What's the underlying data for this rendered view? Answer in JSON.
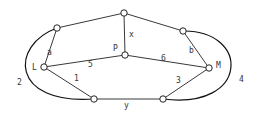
{
  "diagram": {
    "type": "graph",
    "nodes": [
      {
        "id": "A",
        "label": "",
        "x": 57,
        "y": 28
      },
      {
        "id": "T",
        "label": "",
        "x": 124,
        "y": 13
      },
      {
        "id": "B",
        "label": "",
        "x": 183,
        "y": 31
      },
      {
        "id": "L",
        "label": "L",
        "x": 44,
        "y": 67
      },
      {
        "id": "P",
        "label": "P",
        "x": 125,
        "y": 55
      },
      {
        "id": "M",
        "label": "M",
        "x": 209,
        "y": 68
      },
      {
        "id": "Y1",
        "label": "",
        "x": 94,
        "y": 99
      },
      {
        "id": "Y2",
        "label": "",
        "x": 163,
        "y": 99
      }
    ],
    "edges": [
      {
        "from": "A",
        "to": "T",
        "label": ""
      },
      {
        "from": "T",
        "to": "B",
        "label": ""
      },
      {
        "from": "T",
        "to": "P",
        "label": "x"
      },
      {
        "from": "A",
        "to": "L",
        "label": "a"
      },
      {
        "from": "B",
        "to": "M",
        "label": "b"
      },
      {
        "from": "L",
        "to": "P",
        "label": "5"
      },
      {
        "from": "P",
        "to": "M",
        "label": "6"
      },
      {
        "from": "L",
        "to": "Y1",
        "label": "1"
      },
      {
        "from": "M",
        "to": "Y2",
        "label": "3"
      },
      {
        "from": "Y1",
        "to": "Y2",
        "label": "y"
      },
      {
        "from": "A",
        "to": "Y1",
        "label": "2",
        "curved": true
      },
      {
        "from": "B",
        "to": "Y2",
        "label": "4",
        "curved": true
      }
    ],
    "labels": {
      "L": "L",
      "P": "P",
      "M": "M",
      "x": "x",
      "y": "y",
      "a": "a",
      "b": "b",
      "e1": "1",
      "e2": "2",
      "e3": "3",
      "e4": "4",
      "e5": "5",
      "e6": "6"
    }
  }
}
